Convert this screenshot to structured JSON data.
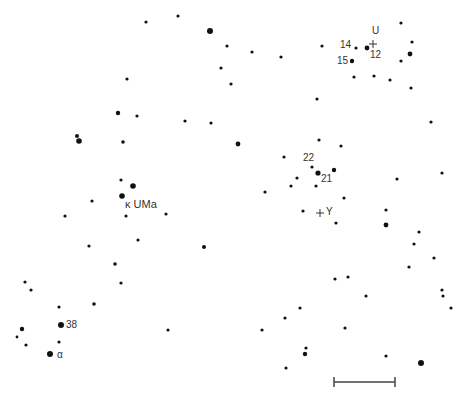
{
  "chart_data": {
    "type": "scatter",
    "title": "",
    "grid": false,
    "stars": [
      {
        "x": 146,
        "y": 22,
        "r": 1.6
      },
      {
        "x": 178,
        "y": 16,
        "r": 1.6
      },
      {
        "x": 210,
        "y": 31,
        "r": 3.0
      },
      {
        "x": 227,
        "y": 46,
        "r": 1.6
      },
      {
        "x": 252,
        "y": 52,
        "r": 1.6
      },
      {
        "x": 281,
        "y": 57,
        "r": 1.6
      },
      {
        "x": 221,
        "y": 68,
        "r": 1.6
      },
      {
        "x": 231,
        "y": 84,
        "r": 1.6
      },
      {
        "x": 127,
        "y": 79,
        "r": 1.6
      },
      {
        "x": 118,
        "y": 113,
        "r": 2.2
      },
      {
        "x": 137,
        "y": 116,
        "r": 1.6
      },
      {
        "x": 185,
        "y": 121,
        "r": 1.6
      },
      {
        "x": 211,
        "y": 123,
        "r": 1.6
      },
      {
        "x": 77,
        "y": 136,
        "r": 2.0
      },
      {
        "x": 79,
        "y": 141,
        "r": 2.8
      },
      {
        "x": 123,
        "y": 142,
        "r": 1.8
      },
      {
        "x": 238,
        "y": 144,
        "r": 2.4
      },
      {
        "x": 121,
        "y": 180,
        "r": 1.6
      },
      {
        "x": 133,
        "y": 186,
        "r": 2.8
      },
      {
        "x": 122,
        "y": 196,
        "r": 2.8
      },
      {
        "x": 92,
        "y": 201,
        "r": 1.6
      },
      {
        "x": 65,
        "y": 216,
        "r": 1.6
      },
      {
        "x": 126,
        "y": 216,
        "r": 1.6
      },
      {
        "x": 166,
        "y": 214,
        "r": 1.6
      },
      {
        "x": 138,
        "y": 240,
        "r": 1.6
      },
      {
        "x": 89,
        "y": 246,
        "r": 1.6
      },
      {
        "x": 204,
        "y": 247,
        "r": 2.0
      },
      {
        "x": 115,
        "y": 264,
        "r": 1.8
      },
      {
        "x": 121,
        "y": 283,
        "r": 1.6
      },
      {
        "x": 94,
        "y": 304,
        "r": 1.8
      },
      {
        "x": 25,
        "y": 282,
        "r": 1.6
      },
      {
        "x": 31,
        "y": 290,
        "r": 1.6
      },
      {
        "x": 59,
        "y": 307,
        "r": 1.6
      },
      {
        "x": 61,
        "y": 325,
        "r": 3.0
      },
      {
        "x": 22,
        "y": 329,
        "r": 2.2
      },
      {
        "x": 17,
        "y": 337,
        "r": 1.4
      },
      {
        "x": 26,
        "y": 345,
        "r": 1.6
      },
      {
        "x": 59,
        "y": 342,
        "r": 1.6
      },
      {
        "x": 50,
        "y": 354,
        "r": 3.0
      },
      {
        "x": 168,
        "y": 330,
        "r": 1.6
      },
      {
        "x": 401,
        "y": 23,
        "r": 1.6
      },
      {
        "x": 322,
        "y": 46,
        "r": 1.6
      },
      {
        "x": 356,
        "y": 48,
        "r": 1.6
      },
      {
        "x": 367,
        "y": 48,
        "r": 2.4
      },
      {
        "x": 352,
        "y": 61,
        "r": 2.2
      },
      {
        "x": 412,
        "y": 42,
        "r": 1.6
      },
      {
        "x": 410,
        "y": 54,
        "r": 2.4
      },
      {
        "x": 401,
        "y": 61,
        "r": 1.6
      },
      {
        "x": 390,
        "y": 80,
        "r": 1.6
      },
      {
        "x": 411,
        "y": 88,
        "r": 1.6
      },
      {
        "x": 374,
        "y": 76,
        "r": 1.6
      },
      {
        "x": 354,
        "y": 77,
        "r": 1.6
      },
      {
        "x": 317,
        "y": 99,
        "r": 1.6
      },
      {
        "x": 431,
        "y": 122,
        "r": 1.6
      },
      {
        "x": 319,
        "y": 140,
        "r": 1.6
      },
      {
        "x": 341,
        "y": 146,
        "r": 1.6
      },
      {
        "x": 284,
        "y": 157,
        "r": 1.6
      },
      {
        "x": 312,
        "y": 167,
        "r": 1.6
      },
      {
        "x": 318,
        "y": 173,
        "r": 2.6
      },
      {
        "x": 334,
        "y": 170,
        "r": 2.2
      },
      {
        "x": 297,
        "y": 178,
        "r": 1.6
      },
      {
        "x": 291,
        "y": 186,
        "r": 1.6
      },
      {
        "x": 316,
        "y": 186,
        "r": 1.6
      },
      {
        "x": 265,
        "y": 192,
        "r": 1.6
      },
      {
        "x": 344,
        "y": 198,
        "r": 1.6
      },
      {
        "x": 303,
        "y": 211,
        "r": 1.6
      },
      {
        "x": 336,
        "y": 223,
        "r": 1.6
      },
      {
        "x": 442,
        "y": 173,
        "r": 1.6
      },
      {
        "x": 397,
        "y": 179,
        "r": 1.6
      },
      {
        "x": 386,
        "y": 210,
        "r": 1.6
      },
      {
        "x": 386,
        "y": 225,
        "r": 2.4
      },
      {
        "x": 419,
        "y": 232,
        "r": 1.6
      },
      {
        "x": 414,
        "y": 244,
        "r": 1.6
      },
      {
        "x": 434,
        "y": 258,
        "r": 1.6
      },
      {
        "x": 409,
        "y": 267,
        "r": 1.6
      },
      {
        "x": 335,
        "y": 279,
        "r": 1.6
      },
      {
        "x": 348,
        "y": 277,
        "r": 1.6
      },
      {
        "x": 366,
        "y": 296,
        "r": 1.6
      },
      {
        "x": 442,
        "y": 290,
        "r": 1.6
      },
      {
        "x": 443,
        "y": 296,
        "r": 1.6
      },
      {
        "x": 451,
        "y": 308,
        "r": 1.6
      },
      {
        "x": 300,
        "y": 308,
        "r": 1.6
      },
      {
        "x": 285,
        "y": 318,
        "r": 1.6
      },
      {
        "x": 345,
        "y": 328,
        "r": 1.6
      },
      {
        "x": 306,
        "y": 348,
        "r": 1.6
      },
      {
        "x": 305,
        "y": 354,
        "r": 2.2
      },
      {
        "x": 286,
        "y": 368,
        "r": 1.6
      },
      {
        "x": 386,
        "y": 356,
        "r": 1.6
      },
      {
        "x": 421,
        "y": 363,
        "r": 3.0
      },
      {
        "x": 262,
        "y": 330,
        "r": 1.6
      }
    ],
    "annotations": [
      {
        "text": "U",
        "x": 372,
        "y": 29
      },
      {
        "text": "14",
        "x": 341,
        "y": 42
      },
      {
        "text": "12",
        "x": 370,
        "y": 52
      },
      {
        "text": "15",
        "x": 338,
        "y": 56
      },
      {
        "text": "22",
        "x": 303,
        "y": 154
      },
      {
        "text": "21",
        "x": 321,
        "y": 175
      },
      {
        "text": "κ UMa",
        "x": 125,
        "y": 201
      },
      {
        "text": "Y",
        "x": 325,
        "y": 208
      },
      {
        "text": "38",
        "x": 66,
        "y": 321
      },
      {
        "text": "α",
        "x": 58,
        "y": 351
      }
    ],
    "crosses": [
      {
        "name": "U",
        "x": 373,
        "y": 44
      },
      {
        "name": "Y",
        "x": 320,
        "y": 213
      }
    ],
    "scale_bar": {
      "x1": 334,
      "x2": 395,
      "y": 382
    }
  },
  "labels": {
    "u": "U",
    "n14": "14",
    "n12": "12",
    "n15": "15",
    "n22": "22",
    "n21": "21",
    "kappa": "κ UMa",
    "y": "Y",
    "n38": "38",
    "alpha": "α"
  },
  "colors": {
    "ink": "#111111",
    "background": "#ffffff",
    "label": "#333333"
  }
}
